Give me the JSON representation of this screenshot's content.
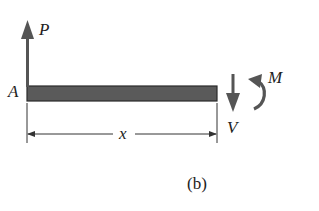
{
  "figure": {
    "caption": "(b)",
    "labels": {
      "point_a": "A",
      "force_p": "P",
      "shear_v": "V",
      "moment_m": "M",
      "length_x": "x"
    },
    "colors": {
      "beam_fill": "#5a5a5a",
      "arrow": "#555555",
      "line": "#333333",
      "text": "#222222",
      "background": "#ffffff"
    }
  }
}
